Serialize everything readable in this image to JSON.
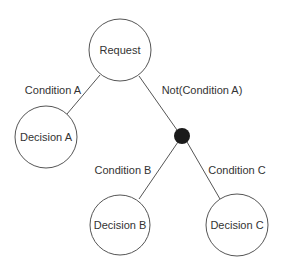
{
  "diagram": {
    "type": "decision-tree",
    "nodes": {
      "request": "Request",
      "decision_a": "Decision A",
      "decision_b": "Decision B",
      "decision_c": "Decision C"
    },
    "edges": {
      "request_to_decision_a": "Condition A",
      "request_to_junction": "Not(Condition A)",
      "junction_to_decision_b": "Condition B",
      "junction_to_decision_c": "Condition C"
    },
    "colors": {
      "junction": "#1a1a1a",
      "stroke": "#555555",
      "text": "#333333"
    }
  }
}
